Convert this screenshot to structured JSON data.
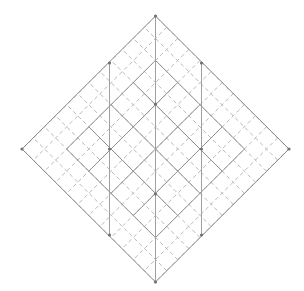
{
  "figure": {
    "type": "geometric-lattice",
    "background_color": "#ffffff",
    "canvas": {
      "width": 304,
      "height": 291
    }
  },
  "style": {
    "outline_color": "#8a8a8a",
    "solid_color": "#8f8f8f",
    "dashed_color": "#b9b9b9",
    "vertical_color": "#a0a0a0",
    "node_color": "#707070",
    "outline_width": 1,
    "solid_width": 1,
    "dashed_width": 1,
    "vertical_width": 1,
    "dash_pattern": "4 3"
  },
  "geometry": {
    "center": {
      "x": 155.5,
      "y": 149
    },
    "half_diagonal_x": 133.5,
    "half_diagonal_y": 133,
    "outer_vertices": [
      {
        "name": "top",
        "x": 155.5,
        "y": 16
      },
      {
        "name": "right",
        "x": 289,
        "y": 149
      },
      {
        "name": "bottom",
        "x": 155.5,
        "y": 282
      },
      {
        "name": "left",
        "x": 22,
        "y": 149
      }
    ],
    "dashed_grid_spacing": 22.2,
    "solid_grid_spacing": 44.5,
    "solid_grid_extent": 2,
    "vertical_lines": [
      {
        "name": "vertical-left",
        "x": 109.5,
        "y1": 63,
        "y2": 235
      },
      {
        "name": "vertical-center",
        "x": 155.5,
        "y1": 16,
        "y2": 282
      },
      {
        "name": "vertical-right",
        "x": 201.5,
        "y1": 63,
        "y2": 235
      }
    ],
    "node_radius": 1.6,
    "nodes": [
      {
        "x": 155.5,
        "y": 16
      },
      {
        "x": 109.5,
        "y": 63
      },
      {
        "x": 201.5,
        "y": 63
      },
      {
        "x": 155.5,
        "y": 104
      },
      {
        "x": 109.5,
        "y": 149
      },
      {
        "x": 201.5,
        "y": 149
      },
      {
        "x": 155.5,
        "y": 194
      },
      {
        "x": 109.5,
        "y": 235
      },
      {
        "x": 201.5,
        "y": 235
      },
      {
        "x": 155.5,
        "y": 282
      },
      {
        "x": 22,
        "y": 149
      },
      {
        "x": 289,
        "y": 149
      }
    ]
  }
}
